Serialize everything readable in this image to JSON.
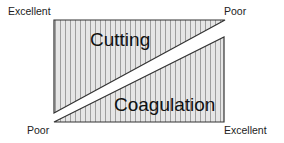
{
  "diagram": {
    "upper_shape": {
      "label": "Cutting",
      "left_end": "Excellent",
      "right_end": "Poor"
    },
    "lower_shape": {
      "label": "Coagulation",
      "left_end": "Poor",
      "right_end": "Excellent"
    },
    "colors": {
      "fill": "#e6e6e6",
      "stripe": "#8c8c8c",
      "outline": "#333333"
    }
  }
}
